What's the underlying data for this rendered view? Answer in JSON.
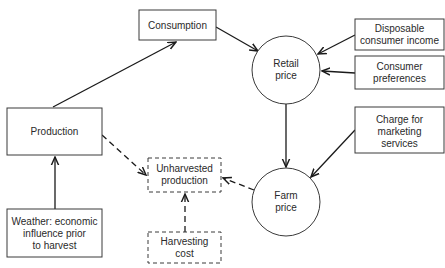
{
  "diagram": {
    "nodes": {
      "consumption": {
        "lines": [
          "Consumption"
        ],
        "shape": "box"
      },
      "retail_price": {
        "lines": [
          "Retail",
          "price"
        ],
        "shape": "circle"
      },
      "disposable_income": {
        "lines": [
          "Disposable",
          "consumer income"
        ],
        "shape": "box"
      },
      "consumer_preferences": {
        "lines": [
          "Consumer",
          "preferences"
        ],
        "shape": "box"
      },
      "marketing_charge": {
        "lines": [
          "Charge for",
          "marketing",
          "services"
        ],
        "shape": "box"
      },
      "production": {
        "lines": [
          "Production"
        ],
        "shape": "box"
      },
      "farm_price": {
        "lines": [
          "Farm",
          "price"
        ],
        "shape": "circle"
      },
      "unharvested_production": {
        "lines": [
          "Unharvested",
          "production"
        ],
        "shape": "dashed-box"
      },
      "harvesting_cost": {
        "lines": [
          "Harvesting",
          "cost"
        ],
        "shape": "dashed-box"
      },
      "weather": {
        "lines": [
          "Weather: economic",
          "influence prior",
          "to harvest"
        ],
        "shape": "box"
      }
    },
    "edges": [
      {
        "from": "production",
        "to": "consumption",
        "style": "solid"
      },
      {
        "from": "consumption",
        "to": "retail_price",
        "style": "solid"
      },
      {
        "from": "disposable_income",
        "to": "retail_price",
        "style": "solid"
      },
      {
        "from": "consumer_preferences",
        "to": "retail_price",
        "style": "solid"
      },
      {
        "from": "retail_price",
        "to": "farm_price",
        "style": "solid"
      },
      {
        "from": "marketing_charge",
        "to": "farm_price",
        "style": "solid"
      },
      {
        "from": "weather",
        "to": "production",
        "style": "solid"
      },
      {
        "from": "production",
        "to": "unharvested_production",
        "style": "dashed"
      },
      {
        "from": "farm_price",
        "to": "unharvested_production",
        "style": "dashed"
      },
      {
        "from": "harvesting_cost",
        "to": "unharvested_production",
        "style": "dashed"
      }
    ]
  }
}
